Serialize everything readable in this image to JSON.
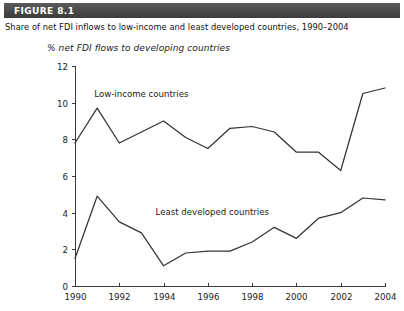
{
  "figure": {
    "band_label": "FIGURE 8.1",
    "caption": "Share of net FDI inflows to low-income and least developed countries, 1990–2004",
    "band_color": "#4a4a4a",
    "band_text_color": "#ffffff",
    "line_color": "#333333"
  },
  "chart_data": {
    "type": "line",
    "title": "",
    "subtitle": "",
    "axis_title": "% net FDI flows to developing countries",
    "xlabel": "",
    "ylabel": "% net FDI flows to developing countries",
    "x": [
      1990,
      1991,
      1992,
      1993,
      1994,
      1995,
      1996,
      1997,
      1998,
      1999,
      2000,
      2001,
      2002,
      2003,
      2004
    ],
    "xlim": [
      1990,
      2004
    ],
    "ylim": [
      0,
      12
    ],
    "x_tick_labels": [
      "1990",
      "1992",
      "1994",
      "1996",
      "1998",
      "2000",
      "2002",
      "2004"
    ],
    "x_ticks": [
      1990,
      1992,
      1994,
      1996,
      1998,
      2000,
      2002,
      2004
    ],
    "y_tick_labels": [
      "0",
      "2",
      "4",
      "6",
      "8",
      "10",
      "12"
    ],
    "y_ticks": [
      0,
      2,
      4,
      6,
      8,
      10,
      12
    ],
    "grid": false,
    "legend": "inline-annotations",
    "series": [
      {
        "name": "Low-income countries",
        "label_x": 1993.0,
        "label_y": 10.3,
        "values": [
          7.8,
          9.7,
          7.8,
          8.4,
          9.0,
          8.1,
          7.5,
          8.6,
          8.7,
          8.4,
          7.3,
          7.3,
          6.3,
          10.5,
          10.8
        ]
      },
      {
        "name": "Least developed countries",
        "label_x": 1996.2,
        "label_y": 3.9,
        "values": [
          1.5,
          4.9,
          3.5,
          2.9,
          1.1,
          1.8,
          1.9,
          1.9,
          2.4,
          3.2,
          2.6,
          3.7,
          4.0,
          4.8,
          4.7
        ]
      }
    ]
  }
}
